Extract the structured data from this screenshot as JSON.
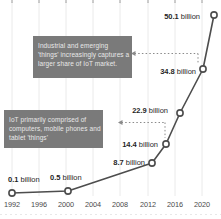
{
  "chart_data": {
    "type": "line",
    "title": "",
    "unit": "billion",
    "points": [
      {
        "year": 1992,
        "value": 0.1,
        "label": "0.1 billion"
      },
      {
        "year": 2000,
        "value": 0.5,
        "label": "0.5 billion"
      },
      {
        "year": 2012,
        "value": 8.7,
        "label": "8.7 billion"
      },
      {
        "year": 2014,
        "value": 14.4,
        "label": "14.4 billion"
      },
      {
        "year": 2016,
        "value": 22.9,
        "label": "22.9 billion"
      },
      {
        "year": 2018,
        "value": 34.8,
        "label": "34.8 billion"
      },
      {
        "year": 2020,
        "value": 50.1,
        "label": "50.1 billion"
      }
    ],
    "xticks": [
      "1992",
      "1996",
      "2000",
      "2004",
      "2008",
      "2012",
      "2016",
      "2020"
    ],
    "xlabel": "",
    "ylabel": "",
    "ylim": [
      0,
      52
    ],
    "grid": "vertical-light",
    "legend": "none",
    "annotations": [
      {
        "id": "industrial",
        "lines": [
          "Industrial and emerging",
          "'things' increasingly captures a",
          "larger share of IoT market."
        ],
        "target_value": 34.8
      },
      {
        "id": "early-iot",
        "lines": [
          "IoT primarily comprised of",
          "computers, mobile phones and",
          "tablet 'things'"
        ],
        "target_value": 14.4
      }
    ],
    "colors": {
      "line": "#4d4d4d",
      "marker_fill": "#ffffff",
      "marker_stroke": "#4d4d4d",
      "point_label": "#1f1f1f",
      "axis_label": "#4a4a4a",
      "gridline": "#eaeaea",
      "top_tick": "#9a9a9a",
      "arrow": "#8a8a8a",
      "annotation_bg": "#7a7a7a",
      "annotation_text": "#e9e9e9"
    }
  }
}
